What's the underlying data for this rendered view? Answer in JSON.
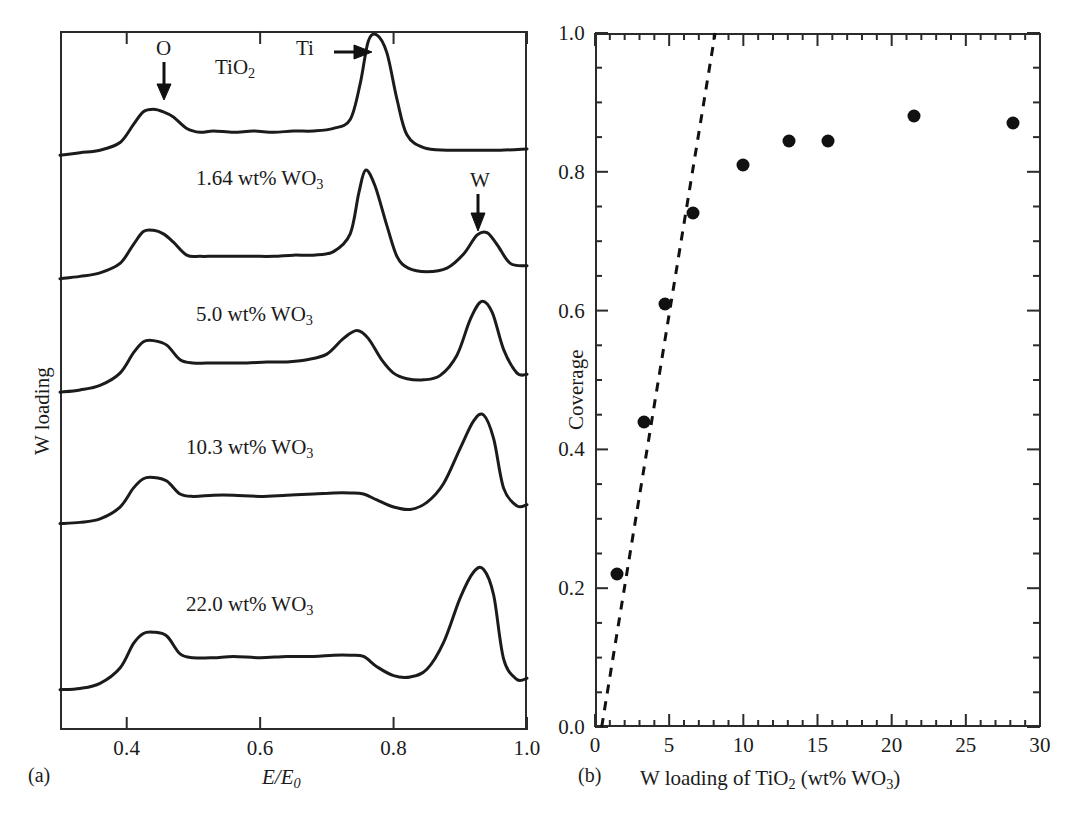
{
  "figure": {
    "panels": [
      {
        "tag": "(a)"
      },
      {
        "tag": "(b)"
      }
    ],
    "caption": ""
  },
  "panel_a": {
    "tag": "(a)",
    "ylabel": "W loading",
    "xlabel_num": "E/E",
    "xlabel_sub": "0",
    "xticks": [
      "0.4",
      "0.6",
      "0.8",
      "1.0"
    ],
    "xtick_values": [
      0.4,
      0.6,
      0.8,
      1.0
    ],
    "xlim": [
      0.3,
      1.0
    ],
    "annotations": [
      {
        "name": "O",
        "label": "O"
      },
      {
        "name": "Ti",
        "label": "Ti"
      },
      {
        "name": "W",
        "label": "W"
      }
    ],
    "traces": [
      {
        "label_main": "TiO",
        "label_sub": "2",
        "label_tail": ""
      },
      {
        "label_main": "1.64 wt% WO",
        "label_sub": "3",
        "label_tail": ""
      },
      {
        "label_main": "5.0 wt% WO",
        "label_sub": "3",
        "label_tail": ""
      },
      {
        "label_main": "10.3 wt% WO",
        "label_sub": "3",
        "label_tail": ""
      },
      {
        "label_main": "22.0 wt% WO",
        "label_sub": "3",
        "label_tail": ""
      }
    ]
  },
  "panel_b": {
    "tag": "(b)",
    "ylabel": "Coverage",
    "xlabel_a": "W loading of TiO",
    "xlabel_sub1": "2",
    "xlabel_b": " (wt% WO",
    "xlabel_sub2": "3",
    "xlabel_c": ")",
    "yticks": [
      "0.0",
      "0.2",
      "0.4",
      "0.6",
      "0.8",
      "1.0"
    ],
    "xticks": [
      "0",
      "5",
      "10",
      "15",
      "20",
      "25",
      "30"
    ]
  },
  "chart_data": [
    {
      "type": "line",
      "title": "",
      "xlabel": "E/E0",
      "ylabel": "W loading",
      "xlim": [
        0.3,
        1.0
      ],
      "grid": false,
      "legend": "none",
      "axis_ticks_x": [
        0.4,
        0.6,
        0.8,
        1.0
      ],
      "annotations": [
        {
          "text": "O",
          "x": 0.45,
          "note": "arrow down to O edge feature"
        },
        {
          "text": "Ti",
          "x": 0.755,
          "note": "arrow right to Ti edge peak"
        },
        {
          "text": "W",
          "x": 0.93,
          "note": "arrow down to W edge peak"
        }
      ],
      "series": [
        {
          "name": "TiO2",
          "offset_index": 0,
          "x": [
            0.3,
            0.33,
            0.36,
            0.39,
            0.41,
            0.425,
            0.44,
            0.455,
            0.47,
            0.49,
            0.51,
            0.53,
            0.56,
            0.59,
            0.62,
            0.65,
            0.68,
            0.71,
            0.735,
            0.75,
            0.762,
            0.775,
            0.79,
            0.805,
            0.82,
            0.845,
            0.88,
            0.92,
            0.96,
            1.0
          ],
          "y": [
            0.06,
            0.08,
            0.1,
            0.16,
            0.3,
            0.4,
            0.42,
            0.4,
            0.36,
            0.27,
            0.24,
            0.25,
            0.24,
            0.25,
            0.24,
            0.25,
            0.25,
            0.27,
            0.34,
            0.62,
            0.95,
            1.0,
            0.86,
            0.5,
            0.22,
            0.12,
            0.1,
            0.1,
            0.1,
            0.11
          ]
        },
        {
          "name": "1.64 wt% WO3",
          "offset_index": 1,
          "x": [
            0.3,
            0.33,
            0.36,
            0.39,
            0.41,
            0.425,
            0.44,
            0.455,
            0.47,
            0.49,
            0.51,
            0.53,
            0.56,
            0.59,
            0.62,
            0.65,
            0.68,
            0.71,
            0.735,
            0.748,
            0.758,
            0.772,
            0.79,
            0.805,
            0.822,
            0.85,
            0.88,
            0.905,
            0.925,
            0.94,
            0.955,
            0.975,
            1.0
          ],
          "y": [
            0.07,
            0.09,
            0.12,
            0.2,
            0.36,
            0.47,
            0.48,
            0.45,
            0.38,
            0.27,
            0.26,
            0.26,
            0.26,
            0.26,
            0.26,
            0.27,
            0.27,
            0.3,
            0.45,
            0.8,
            0.99,
            0.86,
            0.52,
            0.26,
            0.16,
            0.13,
            0.16,
            0.28,
            0.44,
            0.46,
            0.36,
            0.2,
            0.18
          ]
        },
        {
          "name": "5.0 wt% WO3",
          "offset_index": 2,
          "x": [
            0.3,
            0.33,
            0.36,
            0.39,
            0.41,
            0.425,
            0.44,
            0.46,
            0.48,
            0.5,
            0.52,
            0.55,
            0.58,
            0.61,
            0.64,
            0.67,
            0.7,
            0.725,
            0.745,
            0.762,
            0.782,
            0.8,
            0.82,
            0.845,
            0.87,
            0.895,
            0.915,
            0.932,
            0.948,
            0.965,
            0.985,
            1.0
          ],
          "y": [
            0.07,
            0.09,
            0.13,
            0.24,
            0.42,
            0.52,
            0.53,
            0.49,
            0.36,
            0.33,
            0.33,
            0.33,
            0.33,
            0.34,
            0.34,
            0.36,
            0.41,
            0.55,
            0.62,
            0.55,
            0.36,
            0.24,
            0.19,
            0.18,
            0.22,
            0.4,
            0.72,
            0.88,
            0.78,
            0.45,
            0.24,
            0.23
          ]
        },
        {
          "name": "10.3 wt% WO3",
          "offset_index": 3,
          "x": [
            0.3,
            0.33,
            0.36,
            0.39,
            0.41,
            0.425,
            0.44,
            0.46,
            0.48,
            0.5,
            0.53,
            0.56,
            0.6,
            0.64,
            0.68,
            0.71,
            0.735,
            0.755,
            0.775,
            0.8,
            0.825,
            0.85,
            0.875,
            0.9,
            0.92,
            0.935,
            0.95,
            0.965,
            0.985,
            1.0
          ],
          "y": [
            0.08,
            0.09,
            0.12,
            0.22,
            0.38,
            0.46,
            0.47,
            0.44,
            0.33,
            0.31,
            0.32,
            0.32,
            0.31,
            0.32,
            0.33,
            0.34,
            0.34,
            0.33,
            0.28,
            0.22,
            0.2,
            0.26,
            0.42,
            0.72,
            0.95,
            1.0,
            0.8,
            0.38,
            0.23,
            0.24
          ]
        },
        {
          "name": "22.0 wt% WO3",
          "offset_index": 4,
          "x": [
            0.3,
            0.33,
            0.36,
            0.39,
            0.41,
            0.425,
            0.44,
            0.46,
            0.48,
            0.5,
            0.53,
            0.56,
            0.6,
            0.64,
            0.68,
            0.71,
            0.735,
            0.755,
            0.775,
            0.8,
            0.825,
            0.85,
            0.875,
            0.9,
            0.92,
            0.935,
            0.95,
            0.965,
            0.985,
            1.0
          ],
          "y": [
            0.08,
            0.09,
            0.13,
            0.25,
            0.44,
            0.52,
            0.53,
            0.5,
            0.36,
            0.33,
            0.33,
            0.34,
            0.33,
            0.34,
            0.34,
            0.35,
            0.35,
            0.34,
            0.26,
            0.19,
            0.18,
            0.24,
            0.45,
            0.8,
            1.0,
            1.02,
            0.82,
            0.32,
            0.16,
            0.17
          ]
        }
      ]
    },
    {
      "type": "scatter",
      "title": "",
      "xlabel": "W loading of TiO2 (wt% WO3)",
      "ylabel": "Coverage",
      "xlim": [
        0,
        30
      ],
      "ylim": [
        0.0,
        1.0
      ],
      "grid": false,
      "legend": "none",
      "axis_ticks_x": [
        0,
        5,
        10,
        15,
        20,
        25,
        30
      ],
      "axis_ticks_y": [
        0.0,
        0.2,
        0.4,
        0.6,
        0.8,
        1.0
      ],
      "points": [
        {
          "x": 1.5,
          "y": 0.22
        },
        {
          "x": 3.3,
          "y": 0.44
        },
        {
          "x": 4.7,
          "y": 0.61
        },
        {
          "x": 6.6,
          "y": 0.74
        },
        {
          "x": 10.0,
          "y": 0.81
        },
        {
          "x": 13.1,
          "y": 0.845
        },
        {
          "x": 15.7,
          "y": 0.845
        },
        {
          "x": 21.5,
          "y": 0.88
        },
        {
          "x": 28.2,
          "y": 0.87
        }
      ],
      "reference_line": {
        "style": "dashed",
        "x": [
          0.45,
          8.1
        ],
        "y": [
          0.0,
          1.0
        ]
      }
    }
  ]
}
